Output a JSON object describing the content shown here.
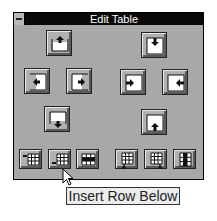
{
  "window": {
    "title": "Edit Table",
    "system_menu_icon": "system-menu-icon"
  },
  "buttons": {
    "large": [
      {
        "name": "insert-row-above",
        "icon": "insert-row-above-icon"
      },
      {
        "name": "insert-cell-down",
        "icon": "shift-cells-down-icon"
      },
      {
        "name": "insert-column-left",
        "icon": "insert-column-left-icon"
      },
      {
        "name": "insert-column-right",
        "icon": "insert-column-right-icon"
      },
      {
        "name": "shift-cells-right",
        "icon": "shift-cells-right-icon"
      },
      {
        "name": "shift-cells-left",
        "icon": "shift-cells-left-icon"
      },
      {
        "name": "insert-row-below",
        "icon": "insert-row-below-icon"
      },
      {
        "name": "shift-cells-up",
        "icon": "shift-cells-up-icon"
      }
    ],
    "small": [
      {
        "name": "insert-row-above",
        "icon": "table-insert-row-above-icon"
      },
      {
        "name": "insert-row-below",
        "icon": "table-insert-row-below-icon"
      },
      {
        "name": "delete-row",
        "icon": "table-delete-row-icon"
      },
      {
        "name": "insert-column-left",
        "icon": "table-insert-column-left-icon"
      },
      {
        "name": "insert-column-right",
        "icon": "table-insert-column-right-icon"
      },
      {
        "name": "delete-column",
        "icon": "table-delete-column-icon"
      }
    ]
  },
  "tooltip": {
    "text": "Insert Row Below"
  }
}
